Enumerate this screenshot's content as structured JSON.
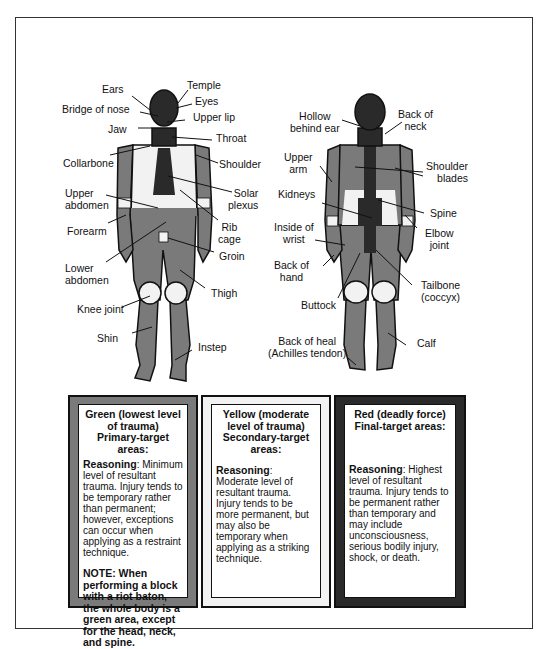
{
  "front_figure": {
    "labels": [
      {
        "id": "ears",
        "text": "Ears"
      },
      {
        "id": "temple",
        "text": "Temple"
      },
      {
        "id": "bridge_of_nose",
        "text": "Bridge of nose"
      },
      {
        "id": "eyes",
        "text": "Eyes"
      },
      {
        "id": "upper_lip",
        "text": "Upper lip"
      },
      {
        "id": "jaw",
        "text": "Jaw"
      },
      {
        "id": "throat",
        "text": "Throat"
      },
      {
        "id": "collarbone",
        "text": "Collarbone"
      },
      {
        "id": "shoulder",
        "text": "Shoulder"
      },
      {
        "id": "upper_abdomen",
        "text": "Upper\nabdomen"
      },
      {
        "id": "solar_plexus",
        "text": "Solar\nplexus"
      },
      {
        "id": "forearm",
        "text": "Forearm"
      },
      {
        "id": "rib_cage",
        "text": "Rib\ncage"
      },
      {
        "id": "groin",
        "text": "Groin"
      },
      {
        "id": "lower_abdomen",
        "text": "Lower\nabdomen"
      },
      {
        "id": "thigh",
        "text": "Thigh"
      },
      {
        "id": "knee_joint",
        "text": "Knee joint"
      },
      {
        "id": "shin",
        "text": "Shin"
      },
      {
        "id": "instep",
        "text": "Instep"
      }
    ]
  },
  "back_figure": {
    "labels": [
      {
        "id": "hollow_behind_ear",
        "text": "Hollow\nbehind ear"
      },
      {
        "id": "back_of_neck",
        "text": "Back of\nneck"
      },
      {
        "id": "upper_arm",
        "text": "Upper\narm"
      },
      {
        "id": "shoulder_blades",
        "text": "Shoulder\nblades"
      },
      {
        "id": "kidneys",
        "text": "Kidneys"
      },
      {
        "id": "spine",
        "text": "Spine"
      },
      {
        "id": "inside_of_wrist",
        "text": "Inside of\nwrist"
      },
      {
        "id": "elbow_joint",
        "text": "Elbow\njoint"
      },
      {
        "id": "back_of_hand",
        "text": "Back of\nhand"
      },
      {
        "id": "tailbone",
        "text": "Tailbone\n(coccyx)"
      },
      {
        "id": "buttock",
        "text": "Buttock"
      },
      {
        "id": "back_of_heal",
        "text": "Back of heal\n(Achilles tendon)"
      },
      {
        "id": "calf",
        "text": "Calf"
      }
    ]
  },
  "legend": {
    "green": {
      "heading_1": "Green (lowest level of trauma)",
      "heading_2": "Primary-target areas:",
      "reasoning_label": "Reasoning",
      "reasoning_text": ": Minimum level of resultant trauma. Injury tends to be temporary rather than permanent; however, exceptions can occur when applying as a restraint technique.",
      "note": "NOTE: When performing a block with a riot baton, the whole body is a green area, except for the head, neck, and spine.",
      "color": "#7a7a7a"
    },
    "yellow": {
      "heading_1": "Yellow (moderate level of trauma)",
      "heading_2": "Secondary-target areas:",
      "reasoning_label": "Reasoning",
      "reasoning_text": ": Moderate level of resultant trauma. Injury tends to be more permanent, but may also be temporary when applying as a striking technique.",
      "color": "#f2f2f2"
    },
    "red": {
      "heading_1": "Red (deadly force)",
      "heading_2": "Final-target areas:",
      "reasoning_label": "Reasoning",
      "reasoning_text": ": Highest level of resultant trauma. Injury tends to be permanent rather than temporary and may include unconsciousness, serious bodily injury, shock, or death.",
      "color": "#2a2a2a"
    }
  }
}
